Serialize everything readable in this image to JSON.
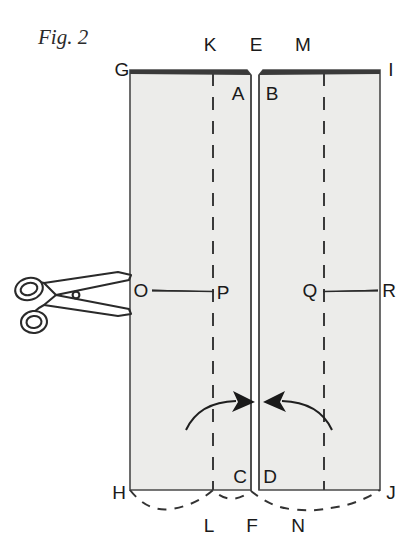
{
  "figure": {
    "caption": "Fig. 2",
    "caption_x": 38,
    "caption_y": 44,
    "background_color": "#ffffff",
    "panel_fill": "#ececea",
    "panel_stroke": "#4a4a4a",
    "ink_color": "#1a1a1a",
    "dash_color": "#3a3a3a"
  },
  "labels": {
    "G": {
      "text": "G",
      "x": 122,
      "y": 76
    },
    "K": {
      "text": "K",
      "x": 205,
      "y": 51
    },
    "E": {
      "text": "E",
      "x": 255,
      "y": 51
    },
    "M": {
      "text": "M",
      "x": 303,
      "y": 51
    },
    "I": {
      "text": "I",
      "x": 391,
      "y": 76
    },
    "A": {
      "text": "A",
      "x": 238,
      "y": 97
    },
    "B": {
      "text": "B",
      "x": 270,
      "y": 97
    },
    "O": {
      "text": "O",
      "x": 140,
      "y": 296
    },
    "P": {
      "text": "P",
      "x": 220,
      "y": 296
    },
    "Q": {
      "text": "Q",
      "x": 302,
      "y": 296
    },
    "R": {
      "text": "R",
      "x": 386,
      "y": 296
    },
    "C": {
      "text": "C",
      "x": 238,
      "y": 482
    },
    "D": {
      "text": "D",
      "x": 268,
      "y": 482
    },
    "H": {
      "text": "H",
      "x": 119,
      "y": 500
    },
    "J": {
      "text": "J",
      "x": 390,
      "y": 500
    },
    "L": {
      "text": "L",
      "x": 207,
      "y": 531
    },
    "F": {
      "text": "F",
      "x": 251,
      "y": 531
    },
    "N": {
      "text": "N",
      "x": 297,
      "y": 531
    }
  },
  "shapes": {
    "left_panel": {
      "name": "left-flap-panel",
      "points": "130,70 247,70 251,75 251,490 130,490"
    },
    "right_panel": {
      "name": "right-flap-panel",
      "points": "259,75 263,70 380,70 380,490 259,490"
    },
    "left_fold_dash": {
      "x": 213,
      "y1": 73,
      "y2": 490
    },
    "right_fold_dash": {
      "x": 324,
      "y1": 73,
      "y2": 490
    },
    "cut_line_left": {
      "x1": 152,
      "y1": 290,
      "x2": 213,
      "y2": 291
    },
    "cut_line_right": {
      "x1": 324,
      "y1": 291,
      "x2": 378,
      "y2": 290
    },
    "bottom_scallop": "M130,490 Q150,512 172,508 Q192,504 213,490 Q232,506 251,490 Q270,506 290,508 Q312,512 330,508 Q356,506 380,490",
    "arrow_left": {
      "path": "M188,428 Q205,400 242,403",
      "tip": "242,403"
    },
    "arrow_right": {
      "path": "M330,428 Q312,400 276,403",
      "tip": "276,403"
    }
  },
  "scissors": {
    "name": "scissors-icon",
    "x": 12,
    "y": 262,
    "width": 130,
    "height": 74,
    "stroke": "#2a2a2a"
  }
}
